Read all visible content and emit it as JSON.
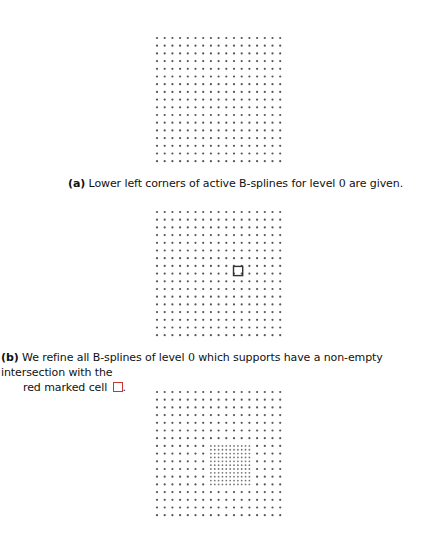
{
  "figure": {
    "panels": [
      {
        "id": "a",
        "label": "(a)",
        "caption_pre": "Lower left corners of active B-splines for level ",
        "caption_math": "0",
        "caption_post": " are given.",
        "grid": {
          "cols": 17,
          "rows": 17,
          "spacing": 7.7
        },
        "marked_cell": null,
        "refined_region": null
      },
      {
        "id": "b",
        "label": "(b)",
        "caption_pre": "We refine all B-splines of level ",
        "caption_math": "0",
        "caption_post": " which supports have a non-empty intersection with the",
        "caption_line2": "red marked cell ",
        "caption_end": ".",
        "grid": {
          "cols": 17,
          "rows": 17,
          "spacing": 7.7
        },
        "marked_cell": {
          "col": 10,
          "row": 7
        },
        "refined_region": null
      },
      {
        "id": "c",
        "label": "",
        "grid": {
          "cols": 17,
          "rows": 17,
          "spacing": 7.7
        },
        "marked_cell": null,
        "refined_region": {
          "col_start": 7,
          "col_end": 12,
          "row_start": 7,
          "row_end": 12,
          "subdivision": 2
        }
      }
    ],
    "colors": {
      "dot": "#555555",
      "fine_dot": "#777777",
      "marked_cell": "#333333"
    }
  }
}
